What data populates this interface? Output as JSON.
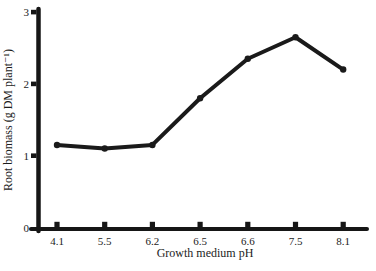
{
  "chart_data": {
    "type": "line",
    "categories": [
      "4.1",
      "5.5",
      "6.2",
      "6.5",
      "6.6",
      "7.5",
      "8.1"
    ],
    "series": [
      {
        "name": "root-biomass",
        "values": [
          1.15,
          1.1,
          1.15,
          1.8,
          2.35,
          2.65,
          2.2
        ]
      }
    ],
    "title": "",
    "xlabel": "Growth medium pH",
    "ylabel": "Root biomass (g DM plant⁻¹)",
    "ylim": [
      0,
      3
    ],
    "yticks": [
      0,
      1,
      2,
      3
    ],
    "grid": false,
    "legend_position": "none",
    "line_color": "#1a1a1a",
    "axis_color": "#161616",
    "background_color": "#ffffff"
  }
}
